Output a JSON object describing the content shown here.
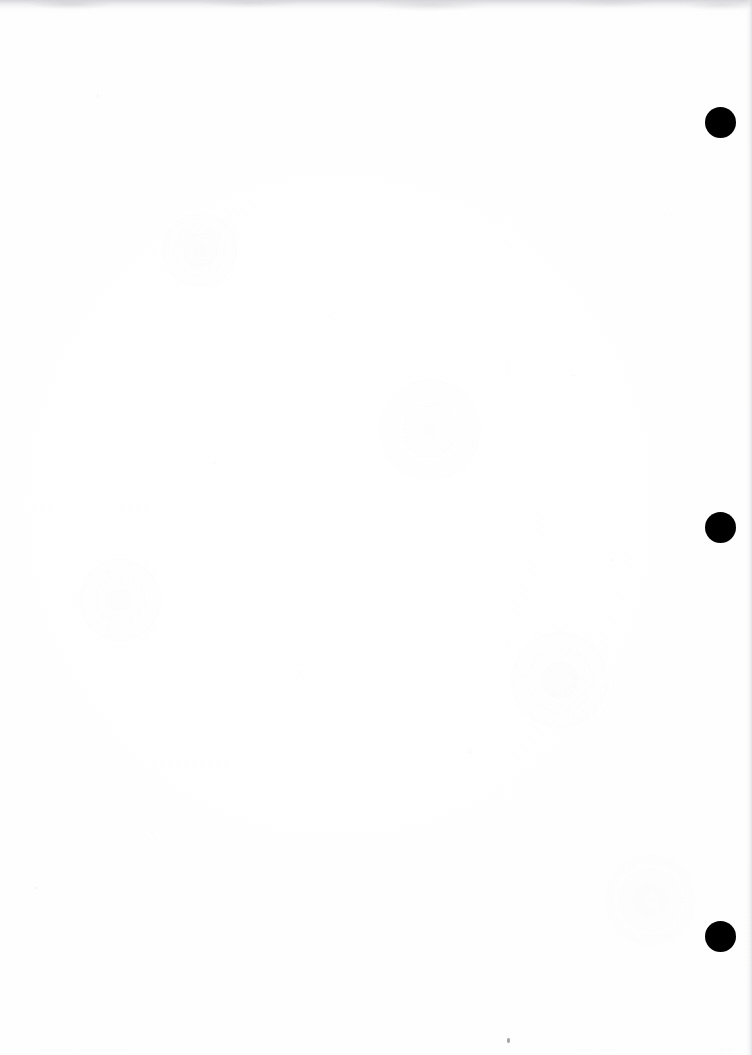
{
  "page": {
    "kind": "scanned-blank-page",
    "width": 752,
    "height": 1055,
    "background_color": "#fefefe",
    "ink_color": "#000000",
    "text_content": "",
    "visible_text_blocks": []
  },
  "marks": {
    "label": "registration marks",
    "shape": "filled-circle",
    "color": "#000000",
    "diameter": 31,
    "items": [
      {
        "id": "registration-mark-1",
        "cx": 720,
        "cy": 122,
        "d": 31
      },
      {
        "id": "registration-mark-2",
        "cx": 720,
        "cy": 527,
        "d": 31
      },
      {
        "id": "registration-mark-3",
        "cx": 720,
        "cy": 936,
        "d": 31
      }
    ]
  },
  "artifacts": {
    "top_edge_band": {
      "color": "#cdcdd2",
      "height": 12
    },
    "right_edge_strip": {
      "color": "#d6d6db",
      "width": 6
    },
    "bottom_edge_mottle": {
      "color": "#b2b2b8",
      "height": 22
    },
    "speck": {
      "cx": 508,
      "cy": 1040,
      "w": 3,
      "h": 5,
      "color": "#5f5f66"
    }
  }
}
